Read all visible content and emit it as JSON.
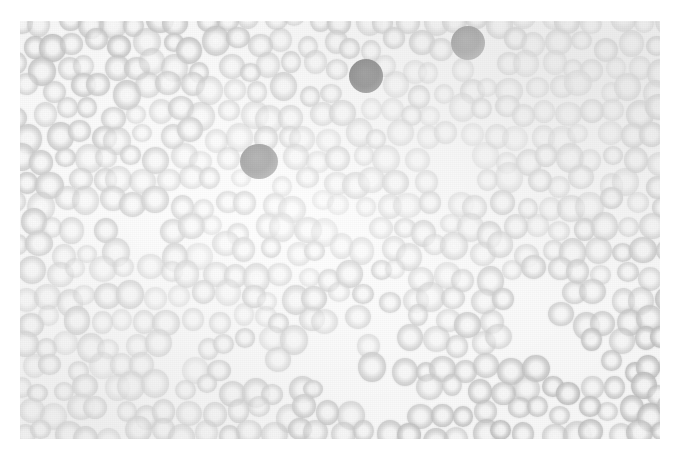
{
  "figure": {
    "kind": "photomicrograph",
    "modality": "light microscopy",
    "color_mode": "grayscale",
    "width": 680,
    "height": 460,
    "plate": {
      "x": 20,
      "y": 21,
      "width": 642,
      "height": 418
    },
    "colors": {
      "page_background": "#ffffff",
      "field_background": "#f3f3f1",
      "erythrocyte": "#b7b7b4",
      "dark_cell": "#686866",
      "very_dark_cell": "#4a4a48",
      "annotation_stroke": "#000000",
      "hollow_arrow_fill": "#ffffff"
    },
    "caption": "",
    "labels": []
  },
  "annotations": {
    "arrows": [
      {
        "id": "solid-arrow-upper-right",
        "style": "solid",
        "fill": "#000000",
        "tip_x": 430,
        "tip_y": 173,
        "tail_x": 380,
        "tail_y": 199,
        "points_at": "dark-clump-upper-right"
      },
      {
        "id": "solid-arrow-left",
        "style": "solid",
        "fill": "#000000",
        "tip_x": 159,
        "tip_y": 249,
        "tail_x": 190,
        "tail_y": 285,
        "points_at": "dark-clump-left"
      },
      {
        "id": "hollow-arrow-left",
        "style": "hollow",
        "fill": "#ffffff",
        "tip_x": 198,
        "tip_y": 332,
        "tail_x": 252,
        "tail_y": 294,
        "points_at": "dark-cell-left-lower"
      },
      {
        "id": "hollow-arrow-center",
        "style": "hollow",
        "fill": "#ffffff",
        "tip_x": 395,
        "tip_y": 313,
        "tail_x": 428,
        "tail_y": 281,
        "points_at": "dark-cell-center-lower"
      }
    ]
  },
  "cells": {
    "dark_cells": [
      {
        "name": "dark-cell-top-center",
        "cx": 366,
        "cy": 76,
        "r": 17,
        "tone": "vdark"
      },
      {
        "name": "segmented-cell-top-right",
        "cx": 468,
        "cy": 43,
        "r": 17,
        "tone": "dark"
      },
      {
        "name": "dark-cell-upper-left-mid",
        "cx": 259,
        "cy": 163,
        "r": 19,
        "tone": "dark"
      },
      {
        "name": "dark-clump-upper-right",
        "cx": 450,
        "cy": 163,
        "r": 22,
        "tone": "dark"
      },
      {
        "name": "dark-clump-left",
        "cx": 146,
        "cy": 231,
        "r": 20,
        "tone": "dark"
      },
      {
        "name": "dark-cell-mid-center",
        "cx": 353,
        "cy": 223,
        "r": 16,
        "tone": "dark"
      },
      {
        "name": "dark-cell-left-lower",
        "cx": 186,
        "cy": 348,
        "r": 17,
        "tone": "vdark"
      },
      {
        "name": "dark-cell-center-lower",
        "cx": 389,
        "cy": 327,
        "r": 15,
        "tone": "vdark"
      },
      {
        "name": "dark-cell-lower-center",
        "cx": 322,
        "cy": 352,
        "r": 19,
        "tone": "dark"
      },
      {
        "name": "dark-cell-lower-center-b",
        "cx": 350,
        "cy": 378,
        "r": 17,
        "tone": "dark"
      },
      {
        "name": "dark-clump-bottom",
        "cx": 398,
        "cy": 400,
        "r": 22,
        "tone": "dark"
      },
      {
        "name": "dark-clump-right",
        "cx": 527,
        "cy": 312,
        "r": 21,
        "tone": "dark"
      },
      {
        "name": "dark-cell-right-lower",
        "cx": 572,
        "cy": 356,
        "r": 16,
        "tone": "vdark"
      },
      {
        "name": "dark-cell-bottom-left",
        "cx": 247,
        "cy": 366,
        "r": 19,
        "tone": "dark"
      }
    ],
    "platelets": [
      {
        "name": "platelet-a",
        "cx": 318,
        "cy": 100,
        "r": 3
      },
      {
        "name": "platelet-b",
        "cx": 260,
        "cy": 338,
        "r": 2
      },
      {
        "name": "platelet-c",
        "cx": 455,
        "cy": 434,
        "r": 2
      },
      {
        "name": "platelet-d",
        "cx": 640,
        "cy": 320,
        "r": 2
      }
    ]
  }
}
